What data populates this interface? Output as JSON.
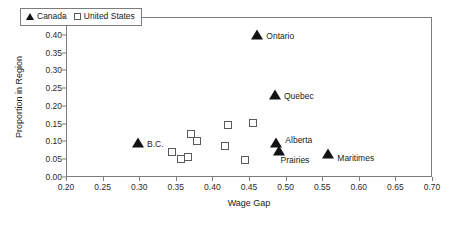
{
  "chart_data": {
    "type": "scatter",
    "title": "",
    "xlabel": "Wage Gap",
    "ylabel": "Proportion in Region",
    "xlim": [
      0.2,
      0.7
    ],
    "ylim": [
      0.0,
      0.45
    ],
    "xticks": [
      "0.20",
      "0.25",
      "0.30",
      "0.35",
      "0.40",
      "0.45",
      "0.50",
      "0.55",
      "0.60",
      "0.65",
      "0.70"
    ],
    "yticks": [
      "0.00",
      "0.05",
      "0.10",
      "0.15",
      "0.20",
      "0.25",
      "0.30",
      "0.35",
      "0.40",
      "0.45"
    ],
    "grid": false,
    "legend_position": "top-left",
    "series": [
      {
        "name": "Canada",
        "marker": "filled-triangle",
        "color": "#131313",
        "points": [
          {
            "label": "B.C.",
            "x": 0.297,
            "y": 0.098,
            "label_dx": 9,
            "label_dy": 1
          },
          {
            "label": "Ontario",
            "x": 0.46,
            "y": 0.402,
            "label_dx": 9,
            "label_dy": 1
          },
          {
            "label": "Quebec",
            "x": 0.484,
            "y": 0.233,
            "label_dx": 9,
            "label_dy": 1
          },
          {
            "label": "Alberta",
            "x": 0.486,
            "y": 0.098,
            "label_dx": 9,
            "label_dy": -3
          },
          {
            "label": "Prairies",
            "x": 0.489,
            "y": 0.076,
            "label_dx": 2,
            "label_dy": 9
          },
          {
            "label": "Maritimes",
            "x": 0.557,
            "y": 0.068,
            "label_dx": 9,
            "label_dy": 4
          }
        ]
      },
      {
        "name": "United States",
        "marker": "open-square",
        "color": "#5a5a5a",
        "points": [
          {
            "label": "",
            "x": 0.343,
            "y": 0.073
          },
          {
            "label": "",
            "x": 0.356,
            "y": 0.053
          },
          {
            "label": "",
            "x": 0.365,
            "y": 0.059
          },
          {
            "label": "",
            "x": 0.369,
            "y": 0.124
          },
          {
            "label": "",
            "x": 0.377,
            "y": 0.104
          },
          {
            "label": "",
            "x": 0.416,
            "y": 0.09
          },
          {
            "label": "",
            "x": 0.42,
            "y": 0.149
          },
          {
            "label": "",
            "x": 0.443,
            "y": 0.051
          },
          {
            "label": "",
            "x": 0.454,
            "y": 0.155
          }
        ]
      }
    ],
    "legend": [
      {
        "label": "Canada",
        "marker": "filled-triangle"
      },
      {
        "label": "United States",
        "marker": "open-square"
      }
    ]
  }
}
